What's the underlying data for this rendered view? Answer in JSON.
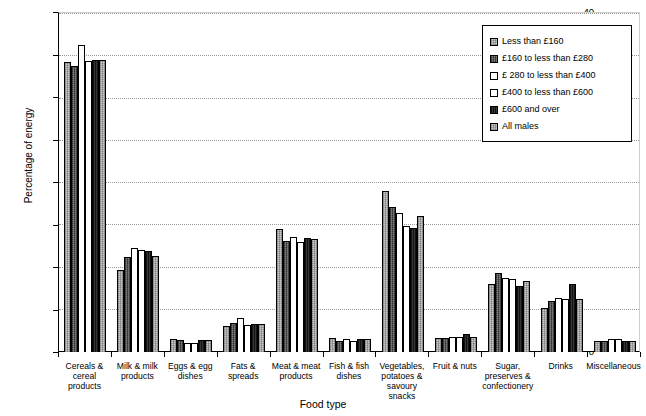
{
  "chart_data": {
    "type": "bar",
    "title": "",
    "xlabel": "Food type",
    "ylabel": "Percentage of energy",
    "ylim": [
      0,
      40
    ],
    "yticks": [
      0,
      5,
      10,
      15,
      20,
      25,
      30,
      35,
      40
    ],
    "grid": true,
    "legend_position": "top-right",
    "categories": [
      "Cereals & cereal products",
      "Milk & milk products",
      "Eggs & egg dishes",
      "Fats & spreads",
      "Meat & meat products",
      "Fish & fish dishes",
      "Vegetables, potatoes & savoury snacks",
      "Fruit & nuts",
      "Sugar, preserves & confectionery",
      "Drinks",
      "Miscellaneous"
    ],
    "category_lines": [
      [
        "Cereals &",
        "cereal",
        "products"
      ],
      [
        "Milk & milk",
        "products"
      ],
      [
        "Eggs & egg",
        "dishes"
      ],
      [
        "Fats &",
        "spreads"
      ],
      [
        "Meat & meat",
        "products"
      ],
      [
        "Fish & fish",
        "dishes"
      ],
      [
        "Vegetables,",
        "potatoes &",
        "savoury",
        "snacks"
      ],
      [
        "Fruit & nuts"
      ],
      [
        "Sugar,",
        "preserves &",
        "confectionery"
      ],
      [
        "Drinks"
      ],
      [
        "Miscellaneous"
      ]
    ],
    "series": [
      {
        "name": "Less than £160",
        "pattern": "light-grey-stipple",
        "values": [
          34.3,
          9.7,
          1.5,
          3.1,
          14.6,
          1.6,
          19.0,
          1.6,
          8.0,
          5.2,
          1.3
        ]
      },
      {
        "name": "£160 to less than £280",
        "pattern": "dark-grey-stipple",
        "values": [
          33.8,
          11.2,
          1.4,
          3.4,
          13.1,
          1.3,
          17.2,
          1.6,
          9.3,
          6.0,
          1.3
        ]
      },
      {
        "name": "£ 280 to less than £400",
        "pattern": "white",
        "values": [
          36.3,
          12.3,
          1.1,
          4.0,
          13.6,
          1.5,
          16.4,
          1.8,
          8.8,
          6.4,
          1.5
        ]
      },
      {
        "name": "£400 to less than £600",
        "pattern": "white",
        "values": [
          34.4,
          12.1,
          1.1,
          3.2,
          13.0,
          1.3,
          14.9,
          1.8,
          8.7,
          6.3,
          1.5
        ]
      },
      {
        "name": "£600 and over",
        "pattern": "black",
        "values": [
          34.5,
          11.9,
          1.4,
          3.3,
          13.5,
          1.5,
          14.7,
          2.1,
          7.8,
          8.0,
          1.3
        ]
      },
      {
        "name": "All males",
        "pattern": "light-grey-stipple",
        "values": [
          34.6,
          11.4,
          1.4,
          3.3,
          13.4,
          1.5,
          16.1,
          1.8,
          8.4,
          6.3,
          1.3
        ]
      }
    ]
  },
  "legend": {
    "items": [
      {
        "label": "Less than £160",
        "swatch": "light-grey-stipple"
      },
      {
        "label": "£160 to less than £280",
        "swatch": "dark-grey-stipple"
      },
      {
        "label": "£ 280 to less than £400",
        "swatch": "white"
      },
      {
        "label": "£400 to less than £600",
        "swatch": "white"
      },
      {
        "label": "£600 and over",
        "swatch": "black"
      },
      {
        "label": "All males",
        "swatch": "light-grey-stipple"
      }
    ]
  },
  "colors": {
    "light_grey": "#c8c8c8",
    "dark_grey": "#6e6e6e",
    "white": "#ffffff",
    "black": "#2a2a2a",
    "light_grey_alt": "#bdbdbd",
    "axis": "#000000",
    "gridline": "#9a9a9a"
  }
}
